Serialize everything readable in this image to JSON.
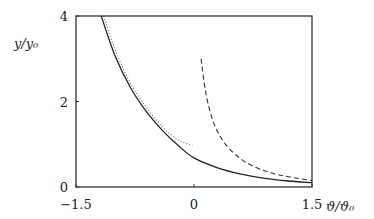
{
  "chart_data": {
    "type": "line",
    "title": "",
    "xlabel": "ϑ/ϑ₀",
    "ylabel": "y/y₀",
    "xlim": [
      -1.5,
      1.5
    ],
    "ylim": [
      0,
      4
    ],
    "grid": false,
    "legend": null,
    "x_ticks": [
      {
        "value": -1.5,
        "label": "−1.5"
      },
      {
        "value": 0,
        "label": "0"
      },
      {
        "value": 1.5,
        "label": "1.5"
      }
    ],
    "y_ticks": [
      {
        "value": 0,
        "label": "0"
      },
      {
        "value": 2,
        "label": "2"
      },
      {
        "value": 4,
        "label": "4"
      }
    ],
    "series": [
      {
        "name": "solid",
        "style": "solid",
        "color": "#222222",
        "x": [
          -1.18,
          -1.0,
          -0.8,
          -0.6,
          -0.4,
          -0.2,
          0.0,
          0.3,
          0.6,
          0.9,
          1.2,
          1.5
        ],
        "y": [
          4.0,
          3.05,
          2.3,
          1.75,
          1.32,
          0.97,
          0.68,
          0.45,
          0.3,
          0.2,
          0.14,
          0.1
        ]
      },
      {
        "name": "dotted",
        "style": "dotted",
        "color": "#666666",
        "x": [
          -1.15,
          -1.0,
          -0.8,
          -0.6,
          -0.4,
          -0.2,
          -0.02
        ],
        "y": [
          4.0,
          3.2,
          2.4,
          1.85,
          1.4,
          1.1,
          0.97
        ]
      },
      {
        "name": "dashed",
        "style": "dashed",
        "color": "#333333",
        "x": [
          0.09,
          0.15,
          0.25,
          0.4,
          0.6,
          0.8,
          1.0,
          1.2,
          1.5
        ],
        "y": [
          3.0,
          2.2,
          1.5,
          1.0,
          0.65,
          0.45,
          0.32,
          0.24,
          0.15
        ]
      }
    ]
  }
}
